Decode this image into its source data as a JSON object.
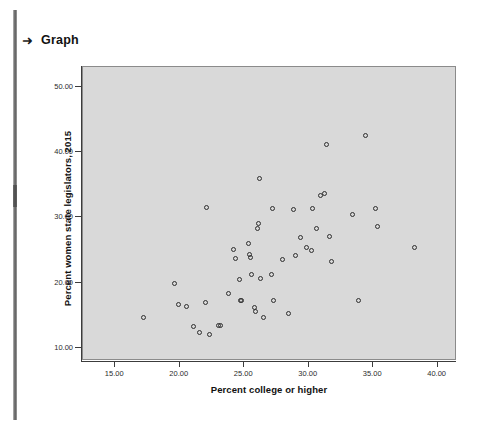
{
  "header": {
    "arrow_icon": "➜",
    "title": "Graph"
  },
  "chart_data": {
    "type": "scatter",
    "title": "",
    "xlabel": "Percent college or higher",
    "ylabel": "Percent women state legislators, 2015",
    "xlim": [
      12.5,
      41.5
    ],
    "ylim": [
      8.0,
      53.0
    ],
    "xticks": [
      "15.00",
      "20.00",
      "25.00",
      "30.00",
      "35.00",
      "40.00"
    ],
    "xtick_values": [
      15,
      20,
      25,
      30,
      35,
      40
    ],
    "yticks": [
      "10.00",
      "20.00",
      "30.00",
      "40.00",
      "50.00"
    ],
    "ytick_values": [
      10,
      20,
      30,
      40,
      50
    ],
    "grid": false,
    "legend": null,
    "marker": "open-circle",
    "marker_color": "#2e2e2e",
    "plot_background": "#d9d9d9",
    "points": [
      {
        "x": 17.2,
        "y": 14.6
      },
      {
        "x": 19.6,
        "y": 19.9
      },
      {
        "x": 19.9,
        "y": 16.6
      },
      {
        "x": 20.5,
        "y": 16.3
      },
      {
        "x": 21.1,
        "y": 13.3
      },
      {
        "x": 21.5,
        "y": 12.3
      },
      {
        "x": 22.0,
        "y": 17.0
      },
      {
        "x": 22.1,
        "y": 31.5
      },
      {
        "x": 22.3,
        "y": 12.0
      },
      {
        "x": 23.0,
        "y": 13.4
      },
      {
        "x": 23.2,
        "y": 13.4
      },
      {
        "x": 23.8,
        "y": 18.3
      },
      {
        "x": 24.2,
        "y": 25.0
      },
      {
        "x": 24.3,
        "y": 23.7
      },
      {
        "x": 24.6,
        "y": 20.4
      },
      {
        "x": 24.7,
        "y": 17.2
      },
      {
        "x": 24.8,
        "y": 17.2
      },
      {
        "x": 25.3,
        "y": 26.0
      },
      {
        "x": 25.4,
        "y": 24.3
      },
      {
        "x": 25.5,
        "y": 23.8
      },
      {
        "x": 25.6,
        "y": 21.2
      },
      {
        "x": 25.8,
        "y": 16.2
      },
      {
        "x": 25.9,
        "y": 15.6
      },
      {
        "x": 26.0,
        "y": 28.3
      },
      {
        "x": 26.1,
        "y": 29.0
      },
      {
        "x": 26.2,
        "y": 35.9
      },
      {
        "x": 26.3,
        "y": 20.7
      },
      {
        "x": 26.5,
        "y": 14.6
      },
      {
        "x": 27.1,
        "y": 21.3
      },
      {
        "x": 27.2,
        "y": 31.3
      },
      {
        "x": 27.3,
        "y": 17.3
      },
      {
        "x": 28.0,
        "y": 23.5
      },
      {
        "x": 28.4,
        "y": 15.3
      },
      {
        "x": 28.8,
        "y": 31.2
      },
      {
        "x": 29.0,
        "y": 24.1
      },
      {
        "x": 29.4,
        "y": 26.9
      },
      {
        "x": 29.8,
        "y": 25.3
      },
      {
        "x": 30.2,
        "y": 24.9
      },
      {
        "x": 30.3,
        "y": 31.4
      },
      {
        "x": 30.6,
        "y": 28.3
      },
      {
        "x": 30.9,
        "y": 33.3
      },
      {
        "x": 31.2,
        "y": 33.7
      },
      {
        "x": 31.4,
        "y": 41.2
      },
      {
        "x": 31.6,
        "y": 27.1
      },
      {
        "x": 31.8,
        "y": 23.3
      },
      {
        "x": 33.4,
        "y": 30.4
      },
      {
        "x": 33.9,
        "y": 17.3
      },
      {
        "x": 34.4,
        "y": 42.5
      },
      {
        "x": 35.2,
        "y": 31.4
      },
      {
        "x": 35.3,
        "y": 28.6
      },
      {
        "x": 38.2,
        "y": 25.4
      }
    ]
  }
}
